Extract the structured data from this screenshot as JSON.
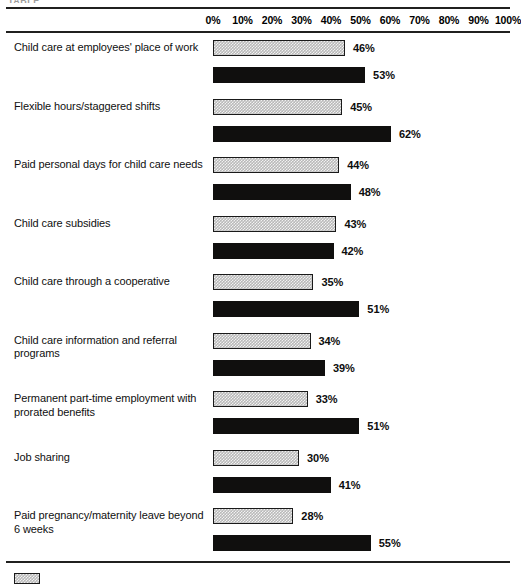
{
  "caption_fragment": "TABLE",
  "axis": {
    "ticks": [
      "0%",
      "10%",
      "20%",
      "30%",
      "40%",
      "50%",
      "60%",
      "70%",
      "80%",
      "90%",
      "100%"
    ]
  },
  "legend": {
    "series_a_label": "",
    "swatch_name": "light-hatched-swatch"
  },
  "colors": {
    "series_a_fill": "#b9b9b9",
    "series_a_border": "#1a1a1a",
    "series_b_fill": "#100f0e",
    "rule": "#20201f",
    "text": "#101010"
  },
  "chart_data": {
    "type": "bar",
    "orientation": "horizontal",
    "title": "",
    "xlabel": "",
    "ylabel": "",
    "xlim": [
      0,
      100
    ],
    "grid": false,
    "legend_position": "bottom-left",
    "categories": [
      "Child care at employees' place of work",
      "Flexible hours/staggered shifts",
      "Paid personal days for child care needs",
      "Child care subsidies",
      "Child care through a cooperative",
      "Child care information and referral programs",
      "Permanent part-time employment with prorated benefits",
      "Job sharing",
      "Paid pregnancy/maternity leave beyond 6 weeks"
    ],
    "series": [
      {
        "name": "series-a",
        "style": "light-hatched",
        "values": [
          46,
          45,
          44,
          43,
          35,
          34,
          33,
          30,
          28
        ],
        "labels": [
          "46%",
          "45%",
          "44%",
          "43%",
          "35%",
          "34%",
          "33%",
          "30%",
          "28%"
        ]
      },
      {
        "name": "series-b",
        "style": "solid-black",
        "values": [
          53,
          62,
          48,
          42,
          51,
          39,
          51,
          41,
          55
        ],
        "labels": [
          "53%",
          "62%",
          "48%",
          "42%",
          "51%",
          "39%",
          "51%",
          "41%",
          "55%"
        ]
      }
    ]
  }
}
